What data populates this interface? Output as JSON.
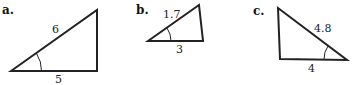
{
  "figure": {
    "triangles": [
      {
        "part_label": "a.",
        "hypotenuse_label": "6",
        "base_label": "5",
        "marked_angle": "left-acute"
      },
      {
        "part_label": "b.",
        "hypotenuse_label": "1.7",
        "base_label": "3",
        "marked_angle": "left-acute"
      },
      {
        "part_label": "c.",
        "hypotenuse_label": "4.8",
        "base_label": "4",
        "marked_angle": "right-acute"
      }
    ]
  }
}
